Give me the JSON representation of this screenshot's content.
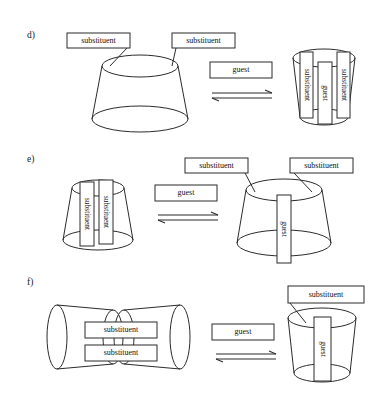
{
  "figure": {
    "background_color": "#ffffff",
    "line_color": "#2b2b2b",
    "text_color": "#111111",
    "labels": {
      "substituent": "substituent",
      "guest": "guest"
    },
    "panels": [
      {
        "id": "d",
        "label": "d)",
        "label_x": 27,
        "label_y": 38,
        "left_structure": {
          "name": "open-cone-with-two-substituents",
          "cone": {
            "orientation": "narrow-top",
            "cx": 140,
            "top_y": 66,
            "top_rx": 38,
            "top_ry": 11,
            "bottom_y": 119,
            "bottom_rx": 48,
            "bottom_ry": 13
          },
          "substituent_boxes": [
            {
              "text": "substituent",
              "x": 67,
              "y": 33,
              "w": 63,
              "h": 15,
              "vertical": false
            },
            {
              "text": "substituent",
              "x": 172,
              "y": 33,
              "w": 63,
              "h": 15,
              "vertical": false
            }
          ],
          "tethers": [
            {
              "x1": 127,
              "y1": 48,
              "x2": 110,
              "y2": 66
            },
            {
              "x1": 176,
              "y1": 48,
              "x2": 172,
              "y2": 66
            }
          ]
        },
        "middle": {
          "guest_box": {
            "text": "guest",
            "x": 210,
            "y": 62,
            "w": 62,
            "h": 16
          },
          "arrow": {
            "x1": 212,
            "x2": 272,
            "y_top": 93,
            "y_bottom": 99
          }
        },
        "right_structure": {
          "name": "inclusion-complex-capped",
          "cone": {
            "orientation": "wide-top",
            "cx": 324,
            "top_y": 58,
            "top_rx": 31,
            "top_ry": 9,
            "bottom_y": 117,
            "bottom_rx": 24,
            "bottom_ry": 8
          },
          "vertical_boxes": [
            {
              "text": "substituent",
              "x": 300,
              "y": 52,
              "w": 13,
              "h": 66,
              "vertical": true
            },
            {
              "text": "guest",
              "x": 318,
              "y": 62,
              "w": 14,
              "h": 62,
              "vertical": true
            },
            {
              "text": "substituent",
              "x": 337,
              "y": 52,
              "w": 13,
              "h": 66,
              "vertical": true
            }
          ]
        }
      },
      {
        "id": "e",
        "label": "e)",
        "label_x": 27,
        "label_y": 162,
        "left_structure": {
          "name": "cone-with-two-internal-substituents",
          "cone": {
            "orientation": "narrow-top",
            "cx": 98,
            "top_y": 188,
            "top_rx": 26,
            "top_ry": 8,
            "bottom_y": 240,
            "bottom_rx": 35,
            "bottom_ry": 10
          },
          "vertical_boxes": [
            {
              "text": "substituent",
              "x": 80,
              "y": 182,
              "w": 14,
              "h": 64,
              "vertical": true
            },
            {
              "text": "substituent",
              "x": 99,
              "y": 180,
              "w": 14,
              "h": 64,
              "vertical": true
            }
          ]
        },
        "middle": {
          "guest_box": {
            "text": "guest",
            "x": 155,
            "y": 185,
            "w": 62,
            "h": 16
          },
          "arrow": {
            "x1": 158,
            "x2": 218,
            "y_top": 215,
            "y_bottom": 221
          }
        },
        "right_structure": {
          "name": "cone-with-guest-and-substituent-caps",
          "cone": {
            "orientation": "narrow-top",
            "cx": 284,
            "top_y": 190,
            "top_rx": 38,
            "top_ry": 11,
            "bottom_y": 243,
            "bottom_rx": 47,
            "bottom_ry": 13
          },
          "substituent_boxes": [
            {
              "text": "substituent",
              "x": 185,
              "y": 158,
              "w": 63,
              "h": 15,
              "vertical": false
            },
            {
              "text": "substituent",
              "x": 290,
              "y": 158,
              "w": 63,
              "h": 15,
              "vertical": false
            }
          ],
          "tethers": [
            {
              "x1": 245,
              "y1": 173,
              "x2": 255,
              "y2": 192
            },
            {
              "x1": 294,
              "y1": 173,
              "x2": 312,
              "y2": 192
            }
          ],
          "vertical_boxes": [
            {
              "text": "guest",
              "x": 277,
              "y": 195,
              "w": 14,
              "h": 68,
              "vertical": true
            }
          ]
        }
      },
      {
        "id": "f",
        "label": "f)",
        "label_x": 27,
        "label_y": 285,
        "left_structure": {
          "name": "bowtie-double-cone-with-substituents",
          "cones": [
            {
              "orientation": "left-facing",
              "outer_cx": 57,
              "outer_y": 337,
              "outer_rx": 10,
              "outer_ry": 32,
              "inner_cx": 113,
              "inner_y": 337,
              "inner_rx": 10,
              "inner_ry": 27
            },
            {
              "orientation": "right-facing",
              "outer_cx": 180,
              "outer_y": 337,
              "outer_rx": 10,
              "outer_ry": 32,
              "inner_cx": 124,
              "inner_y": 337,
              "inner_rx": 10,
              "inner_ry": 27
            }
          ],
          "substituent_boxes": [
            {
              "text": "substituent",
              "x": 85,
              "y": 322,
              "w": 72,
              "h": 16,
              "vertical": false
            },
            {
              "text": "substituent",
              "x": 85,
              "y": 345,
              "w": 72,
              "h": 16,
              "vertical": false
            }
          ]
        },
        "middle": {
          "guest_box": {
            "text": "guest",
            "x": 212,
            "y": 324,
            "w": 62,
            "h": 16
          },
          "arrow": {
            "x1": 216,
            "x2": 276,
            "y_top": 354,
            "y_bottom": 360
          }
        },
        "right_structure": {
          "name": "cone-with-guest-and-one-substituent",
          "cone": {
            "orientation": "wide-top",
            "cx": 322,
            "top_y": 318,
            "top_rx": 34,
            "top_ry": 10,
            "bottom_y": 373,
            "bottom_rx": 28,
            "bottom_ry": 9
          },
          "substituent_boxes": [
            {
              "text": "substituent",
              "x": 288,
              "y": 286,
              "w": 76,
              "h": 17,
              "vertical": false
            }
          ],
          "tethers": [
            {
              "x1": 290,
              "y1": 303,
              "x2": 306,
              "y2": 323
            }
          ],
          "vertical_boxes": [
            {
              "text": "guest",
              "x": 314,
              "y": 317,
              "w": 17,
              "h": 64,
              "vertical": true
            }
          ]
        }
      }
    ]
  }
}
